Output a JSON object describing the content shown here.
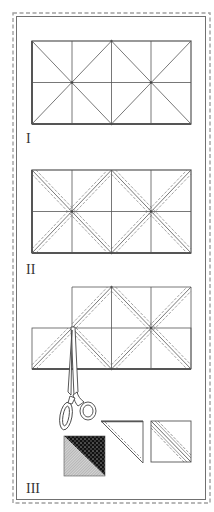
{
  "figure": {
    "colors": {
      "line": "#555555",
      "border": "#999999",
      "dark_fabric": "#2a2a2a",
      "light_fabric": "#bdbdbd"
    }
  },
  "steps": [
    {
      "label": "I",
      "caption": "Mark grid of squares and diagonals on fabric"
    },
    {
      "label": "II",
      "caption": "Stitch seam lines on both sides of diagonals"
    },
    {
      "label": "III",
      "caption": "Cut apart along lines with scissors; open into pieced squares"
    }
  ]
}
